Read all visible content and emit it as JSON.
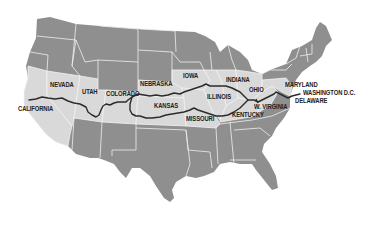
{
  "map": {
    "type": "route-map",
    "region": "United States",
    "colors": {
      "background": "#ffffff",
      "states_default": "#8f8f8f",
      "states_route_corridor": "#d9d9d9",
      "state_borders": "#f2f2f2",
      "route_line": "#2b2b2b",
      "label_text": "#222222"
    },
    "route": {
      "start": "California",
      "end": "Washington D.C."
    },
    "labels": [
      {
        "id": "california",
        "text": "CALIFORNIA",
        "x": 18,
        "y": 109
      },
      {
        "id": "nevada",
        "text": "NEVADA",
        "x": 50,
        "y": 83
      },
      {
        "id": "utah",
        "text": "UTAH",
        "x": 82,
        "y": 91
      },
      {
        "id": "colorado",
        "text": "COLORADO",
        "x": 106,
        "y": 92
      },
      {
        "id": "nebraska",
        "text": "NEBRASKA",
        "x": 140,
        "y": 82
      },
      {
        "id": "iowa",
        "text": "IOWA",
        "x": 183,
        "y": 73
      },
      {
        "id": "kansas",
        "text": "KANSAS",
        "x": 154,
        "y": 105
      },
      {
        "id": "illinois",
        "text": "ILLINOIS",
        "x": 206,
        "y": 96
      },
      {
        "id": "missouri",
        "text": "MISSOURI",
        "x": 186,
        "y": 118
      },
      {
        "id": "indiana",
        "text": "INDIANA",
        "x": 226,
        "y": 78
      },
      {
        "id": "ohio",
        "text": "OHIO",
        "x": 249,
        "y": 88
      },
      {
        "id": "kentucky",
        "text": "KENTUCKY",
        "x": 232,
        "y": 113
      },
      {
        "id": "w-virginia",
        "text": "W. VIRGINIA",
        "x": 254,
        "y": 105
      },
      {
        "id": "maryland",
        "text": "MARYLAND",
        "x": 285,
        "y": 83
      },
      {
        "id": "washington-dc",
        "text": "WASHINGTON D.C.",
        "x": 303,
        "y": 91
      },
      {
        "id": "delaware",
        "text": "DELAWARE",
        "x": 295,
        "y": 99
      }
    ]
  }
}
